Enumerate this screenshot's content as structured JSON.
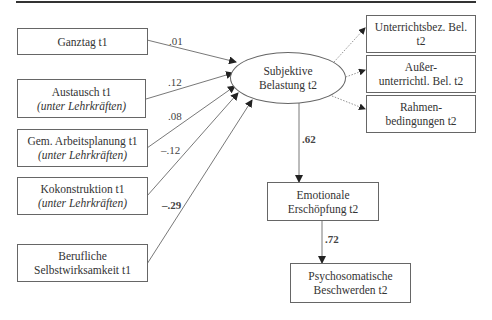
{
  "diagram": {
    "type": "path-model",
    "predictors": [
      {
        "line1": "Ganztag t1",
        "line2": "",
        "coef": ".01",
        "bold": false
      },
      {
        "line1": "Austausch t1",
        "line2": "(unter Lehrkräften)",
        "coef": ".12",
        "bold": false
      },
      {
        "line1": "Gem. Arbeitsplanung t1",
        "line2": "(unter Lehrkräften)",
        "coef": ".08",
        "bold": false
      },
      {
        "line1": "Kokonstruktion t1",
        "line2": "(unter Lehrkräften)",
        "coef": "–.12",
        "bold": false
      },
      {
        "line1": "Berufliche",
        "line2": "Selbstwirksamkeit t1",
        "coef": "–.29",
        "bold": true
      }
    ],
    "latent": {
      "line1": "Subjektive",
      "line2": "Belastung t2"
    },
    "indicators": [
      {
        "line1": "Unterrichtsbez. Bel.",
        "line2": "t2"
      },
      {
        "line1": "Außer-",
        "line2": "unterrichtl. Bel. t2"
      },
      {
        "line1": "Rahmen-",
        "line2": "bedingungen t2"
      }
    ],
    "outcome1": {
      "line1": "Emotionale",
      "line2": "Erschöpfung t2",
      "coef": ".62"
    },
    "outcome2": {
      "line1": "Psychosomatische",
      "line2": "Beschwerden t2",
      "coef": ".72"
    }
  }
}
